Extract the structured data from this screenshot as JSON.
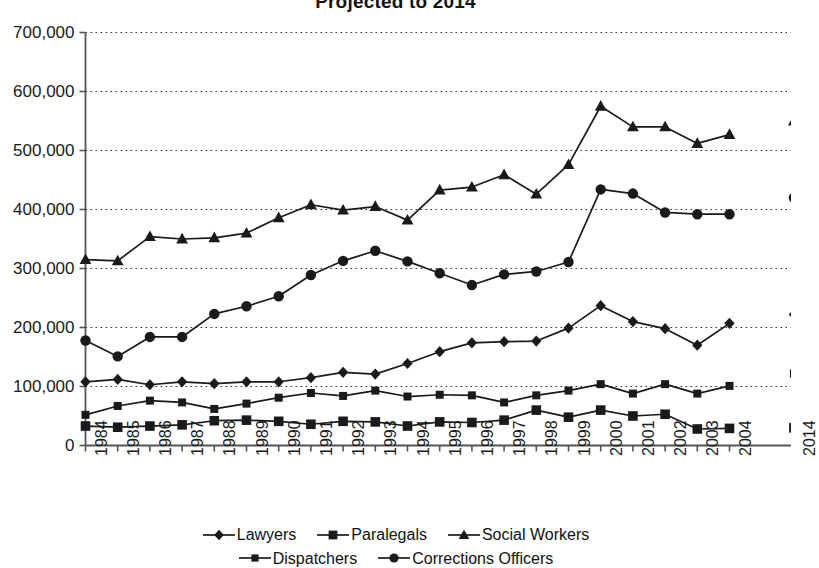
{
  "chart_data": {
    "type": "line",
    "title": "Projected to 2014",
    "xlabel": "",
    "ylabel": "",
    "ylim": [
      0,
      700000
    ],
    "ytick_step": 100000,
    "ytick_labels": [
      "0",
      "100,000",
      "200,000",
      "300,000",
      "400,000",
      "500,000",
      "600,000",
      "700,000"
    ],
    "grid": true,
    "legend_position": "bottom",
    "categories": [
      "1984",
      "1985",
      "1986",
      "1987",
      "1988",
      "1989",
      "1990",
      "1991",
      "1992",
      "1993",
      "1994",
      "1995",
      "1996",
      "1997",
      "1998",
      "1999",
      "2000",
      "2001",
      "2002",
      "2003",
      "2004",
      "2014"
    ],
    "gap_before_last": true,
    "series": [
      {
        "name": "Lawyers",
        "marker": "diamond",
        "values": [
          108000,
          112000,
          103000,
          108000,
          105000,
          108000,
          108000,
          115000,
          124000,
          121000,
          139000,
          159000,
          174000,
          176000,
          177000,
          199000,
          237000,
          210000,
          198000,
          170000,
          207000,
          222000
        ]
      },
      {
        "name": "Paralegals",
        "marker": "square",
        "values": [
          33000,
          31000,
          33000,
          35000,
          42000,
          43000,
          41000,
          36000,
          41000,
          40000,
          33000,
          40000,
          39000,
          43000,
          60000,
          48000,
          60000,
          50000,
          53000,
          28000,
          29000,
          30000
        ]
      },
      {
        "name": "Social Workers",
        "marker": "triangle",
        "values": [
          315000,
          313000,
          354000,
          350000,
          352000,
          360000,
          386000,
          408000,
          399000,
          405000,
          382000,
          433000,
          438000,
          459000,
          426000,
          476000,
          575000,
          540000,
          540000,
          512000,
          527000,
          550000
        ]
      },
      {
        "name": "Dispatchers",
        "marker": "small-square",
        "values": [
          52000,
          67000,
          76000,
          73000,
          62000,
          71000,
          81000,
          89000,
          84000,
          93000,
          83000,
          86000,
          85000,
          73000,
          85000,
          93000,
          104000,
          88000,
          104000,
          88000,
          101000,
          122000
        ]
      },
      {
        "name": "Corrections Officers",
        "marker": "circle",
        "values": [
          178000,
          151000,
          184000,
          184000,
          223000,
          236000,
          253000,
          289000,
          313000,
          330000,
          312000,
          292000,
          272000,
          290000,
          295000,
          311000,
          434000,
          427000,
          395000,
          392000,
          392000,
          420000
        ]
      }
    ]
  },
  "legend": {
    "rows": [
      [
        "Lawyers",
        "Paralegals",
        "Social Workers"
      ],
      [
        "Dispatchers",
        "Corrections Officers"
      ]
    ]
  },
  "colors": {
    "series": "#1a1a1a",
    "grid": "#333333",
    "axis": "#555555",
    "background": "#ffffff"
  }
}
